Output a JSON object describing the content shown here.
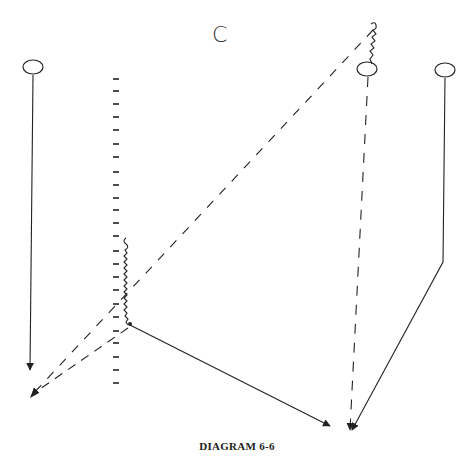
{
  "diagram": {
    "title_letter": "C",
    "caption": "DIAGRAM 6-6",
    "line_color": "#222222",
    "players": [
      {
        "id": "left-player",
        "cx": 33,
        "cy": 67
      },
      {
        "id": "center-right-player",
        "cx": 367,
        "cy": 69
      },
      {
        "id": "right-player",
        "cx": 445,
        "cy": 70
      }
    ],
    "tick_column": {
      "x": 116,
      "y_start": 78,
      "y_end": 385,
      "count": 26
    },
    "paths": [
      {
        "id": "left-player-cut",
        "style": "solid",
        "points": [
          [
            33,
            75
          ],
          [
            30,
            370
          ]
        ],
        "arrow": true
      },
      {
        "id": "pass-from-screen",
        "style": "solid",
        "points": [
          [
            130,
            325
          ],
          [
            330,
            426
          ]
        ],
        "arrow": true
      },
      {
        "id": "right-player-cut",
        "style": "solid",
        "points": [
          [
            445,
            78
          ],
          [
            443,
            262
          ],
          [
            352,
            430
          ]
        ],
        "arrow": true
      },
      {
        "id": "center-player-dash",
        "style": "dashed",
        "points": [
          [
            368,
            77
          ],
          [
            350,
            430
          ]
        ],
        "arrow": true
      },
      {
        "id": "long-diagonal-dash",
        "style": "dashed",
        "points": [
          [
            373,
            30
          ],
          [
            32,
            395
          ]
        ],
        "arrow": true
      },
      {
        "id": "short-diagonal-dash",
        "style": "dashed",
        "points": [
          [
            128,
            328
          ],
          [
            36,
            392
          ]
        ],
        "arrow": false
      }
    ],
    "dribbles": [
      {
        "id": "screen-dribble",
        "from": [
          124,
          238
        ],
        "to": [
          130,
          324
        ]
      },
      {
        "id": "top-dribble",
        "from": [
          373,
          22
        ],
        "to": [
          369,
          60
        ]
      }
    ]
  }
}
